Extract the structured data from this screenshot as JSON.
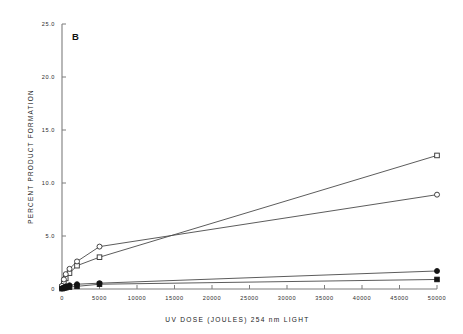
{
  "figure": {
    "panel_label": "B",
    "background_color": "#ffffff",
    "line_color": "#4a4a4a",
    "axis_color": "#7d7d7d",
    "marker_fill_color": "#141414",
    "marker_open_color": "#ffffff"
  },
  "chart_data": {
    "type": "line",
    "title": "",
    "subtitle": "",
    "panel": "B",
    "xlabel": "UV DOSE (JOULES) 254 nm LIGHT",
    "ylabel": "PERCENT PRODUCT FORMATION",
    "xlim": [
      0,
      50000
    ],
    "ylim": [
      0,
      25.0
    ],
    "grid": false,
    "legend_position": "none",
    "xticks": [
      0,
      5000,
      10000,
      15000,
      20000,
      25000,
      30000,
      35000,
      40000,
      45000,
      50000
    ],
    "xtick_labels": [
      "0",
      "5000",
      "10000",
      "15000",
      "20000",
      "25000",
      "30000",
      "35000",
      "40000",
      "45000",
      "50000"
    ],
    "yticks": [
      0,
      5.0,
      10.0,
      15.0,
      20.0,
      25.0
    ],
    "ytick_labels": [
      "0",
      "5.0",
      "10.0",
      "15.0",
      "20.0",
      "25.0"
    ],
    "series": [
      {
        "name": "series-1-open-square",
        "marker": "open-square",
        "x": [
          0,
          250,
          500,
          1000,
          2000,
          5000,
          50000
        ],
        "values": [
          0.2,
          0.6,
          1.0,
          1.5,
          2.2,
          3.0,
          12.6
        ]
      },
      {
        "name": "series-2-open-circle",
        "marker": "open-circle",
        "x": [
          0,
          250,
          500,
          1000,
          2000,
          5000,
          50000
        ],
        "values": [
          0.3,
          0.9,
          1.4,
          1.9,
          2.6,
          4.0,
          8.9
        ]
      },
      {
        "name": "series-3-filled-circle",
        "marker": "filled-circle",
        "x": [
          0,
          250,
          500,
          1000,
          2000,
          5000,
          50000
        ],
        "values": [
          0.05,
          0.15,
          0.25,
          0.35,
          0.45,
          0.55,
          1.7
        ]
      },
      {
        "name": "series-4-filled-square",
        "marker": "filled-square",
        "x": [
          0,
          250,
          500,
          1000,
          2000,
          5000,
          50000
        ],
        "values": [
          0.03,
          0.08,
          0.12,
          0.18,
          0.25,
          0.45,
          0.9
        ]
      }
    ]
  }
}
